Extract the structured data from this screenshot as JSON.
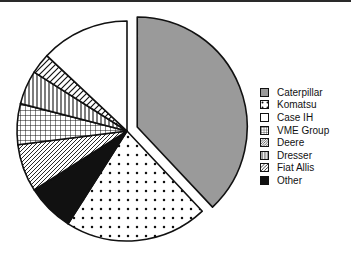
{
  "figure": {
    "border_color": "#2a2a2a",
    "background": "#ffffff"
  },
  "legend": {
    "position": "right",
    "items": [
      {
        "label": "Caterpillar",
        "pattern": "solid-gray",
        "color": "#9a9a9a"
      },
      {
        "label": "Komatsu",
        "pattern": "dots",
        "color": "#ffffff"
      },
      {
        "label": "Case IH",
        "pattern": "none",
        "color": "#ffffff"
      },
      {
        "label": "VME Group",
        "pattern": "grid",
        "color": "#ffffff"
      },
      {
        "label": "Deere",
        "pattern": "diagonal-fine",
        "color": "#ffffff"
      },
      {
        "label": "Dresser",
        "pattern": "vertical",
        "color": "#ffffff"
      },
      {
        "label": "Fiat Allis",
        "pattern": "diagonal",
        "color": "#ffffff"
      },
      {
        "label": "Other",
        "pattern": "solid-black",
        "color": "#111111"
      }
    ]
  },
  "chart_data": {
    "type": "pie",
    "title": "",
    "xlabel": "",
    "ylabel": "",
    "legend_position": "right",
    "exploded_slices": [
      "Caterpillar"
    ],
    "start_angle": 90,
    "direction": "clockwise",
    "categories": [
      "Caterpillar",
      "Komatsu",
      "Case IH",
      "VME Group",
      "Deere",
      "Dresser",
      "Fiat Allis",
      "Other"
    ],
    "values": [
      38,
      21,
      13,
      6,
      7,
      5,
      3,
      7
    ],
    "unit": "percent",
    "slices": [
      {
        "label": "Caterpillar",
        "value": 38,
        "pattern": "solid-gray",
        "color": "#9a9a9a",
        "exploded": true
      },
      {
        "label": "Komatsu",
        "value": 21,
        "pattern": "dots",
        "color": "#ffffff",
        "exploded": false
      },
      {
        "label": "Other",
        "value": 7,
        "pattern": "solid-black",
        "color": "#111111",
        "exploded": false
      },
      {
        "label": "Deere",
        "value": 7,
        "pattern": "diagonal-fine",
        "color": "#ffffff",
        "exploded": false
      },
      {
        "label": "VME Group",
        "value": 6,
        "pattern": "grid",
        "color": "#ffffff",
        "exploded": false
      },
      {
        "label": "Dresser",
        "value": 5,
        "pattern": "vertical",
        "color": "#ffffff",
        "exploded": false
      },
      {
        "label": "Fiat Allis",
        "value": 3,
        "pattern": "diagonal",
        "color": "#ffffff",
        "exploded": false
      },
      {
        "label": "Case IH",
        "value": 13,
        "pattern": "none",
        "color": "#ffffff",
        "exploded": false
      }
    ]
  }
}
